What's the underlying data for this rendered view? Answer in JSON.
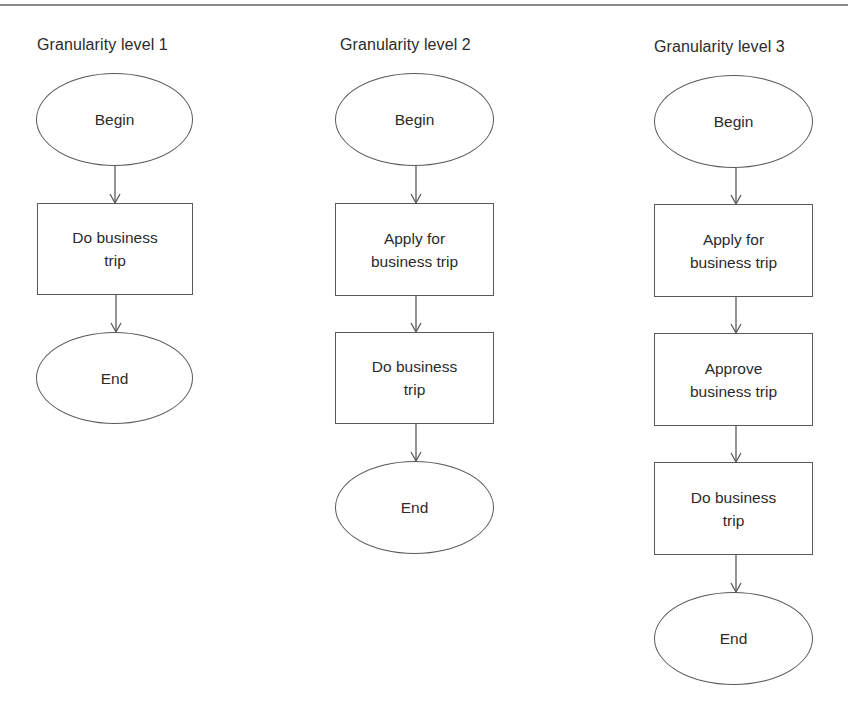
{
  "diagram": {
    "columns": [
      {
        "title": "Granularity level 1",
        "nodes": [
          {
            "type": "ellipse",
            "label": "Begin"
          },
          {
            "type": "process",
            "label": "Do business\ntrip"
          },
          {
            "type": "ellipse",
            "label": "End"
          }
        ]
      },
      {
        "title": "Granularity level 2",
        "nodes": [
          {
            "type": "ellipse",
            "label": "Begin"
          },
          {
            "type": "process",
            "label": "Apply  for\nbusiness trip"
          },
          {
            "type": "process",
            "label": "Do business\ntrip"
          },
          {
            "type": "ellipse",
            "label": "End"
          }
        ]
      },
      {
        "title": "Granularity level 3",
        "nodes": [
          {
            "type": "ellipse",
            "label": "Begin"
          },
          {
            "type": "process",
            "label": "Apply  for\nbusiness trip"
          },
          {
            "type": "process",
            "label": "Approve\nbusiness trip"
          },
          {
            "type": "process",
            "label": "Do business\ntrip"
          },
          {
            "type": "ellipse",
            "label": "End"
          }
        ]
      }
    ],
    "colors": {
      "stroke": "#5a5a5a",
      "text": "#2b2b2b",
      "background": "#ffffff",
      "rule": "#8a8a8a"
    }
  }
}
